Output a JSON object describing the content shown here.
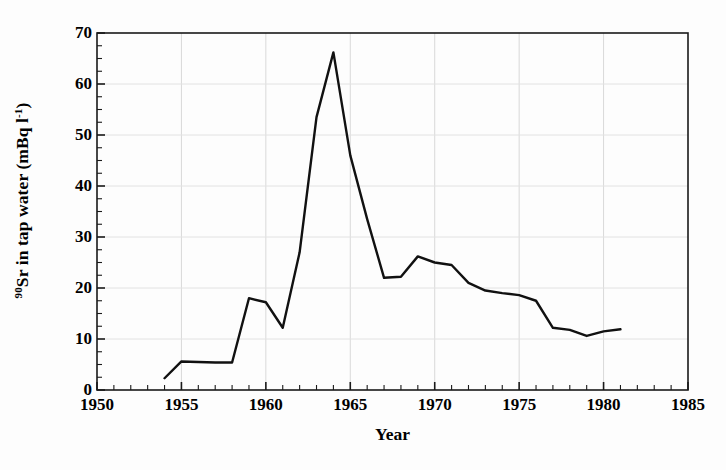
{
  "chart_data": {
    "type": "line",
    "title": "",
    "xlabel": "Year",
    "ylabel": "90Sr in tap water (mBq l-1)",
    "ylabel_parts": {
      "isotope_superscript": "90",
      "text_before_unit": "Sr in tap water (mBq l",
      "unit_superscript": "-1",
      "text_after": ")"
    },
    "xlim": [
      1950,
      1985
    ],
    "ylim": [
      0,
      70
    ],
    "xticks": [
      1950,
      1955,
      1960,
      1965,
      1970,
      1975,
      1980,
      1985
    ],
    "xtick_labels": [
      "1950",
      "1955",
      "1960",
      "1965",
      "1970",
      "1975",
      "1980",
      "1985"
    ],
    "yticks": [
      0,
      10,
      20,
      30,
      40,
      50,
      60,
      70
    ],
    "ytick_labels": [
      "0",
      "10",
      "20",
      "30",
      "40",
      "50",
      "60",
      "70"
    ],
    "x_minor_tick_interval": 1,
    "y_minor_tick_interval": 2.5,
    "grid": "faint major gridlines, both axes",
    "legend": "none",
    "line_color": "#111111",
    "line_width": 2.4,
    "x": [
      1954,
      1955,
      1956,
      1957,
      1958,
      1959,
      1960,
      1961,
      1962,
      1963,
      1964,
      1965,
      1966,
      1967,
      1968,
      1969,
      1970,
      1971,
      1972,
      1973,
      1974,
      1975,
      1976,
      1977,
      1978,
      1979,
      1980,
      1981
    ],
    "values": [
      2.3,
      5.6,
      5.5,
      5.4,
      5.4,
      18.0,
      17.2,
      12.2,
      27.0,
      53.5,
      66.2,
      46.0,
      33.5,
      22.0,
      22.2,
      26.2,
      25.0,
      24.5,
      21.0,
      19.5,
      19.0,
      18.6,
      17.5,
      12.2,
      11.8,
      10.6,
      11.5,
      11.9
    ],
    "series": [
      {
        "name": "90Sr in tap water",
        "x": [
          1954,
          1955,
          1956,
          1957,
          1958,
          1959,
          1960,
          1961,
          1962,
          1963,
          1964,
          1965,
          1966,
          1967,
          1968,
          1969,
          1970,
          1971,
          1972,
          1973,
          1974,
          1975,
          1976,
          1977,
          1978,
          1979,
          1980,
          1981
        ],
        "values": [
          2.3,
          5.6,
          5.5,
          5.4,
          5.4,
          18.0,
          17.2,
          12.2,
          27.0,
          53.5,
          66.2,
          46.0,
          33.5,
          22.0,
          22.2,
          26.2,
          25.0,
          24.5,
          21.0,
          19.5,
          19.0,
          18.6,
          17.5,
          12.2,
          11.8,
          10.6,
          11.5,
          11.9
        ]
      }
    ],
    "annotations": []
  }
}
